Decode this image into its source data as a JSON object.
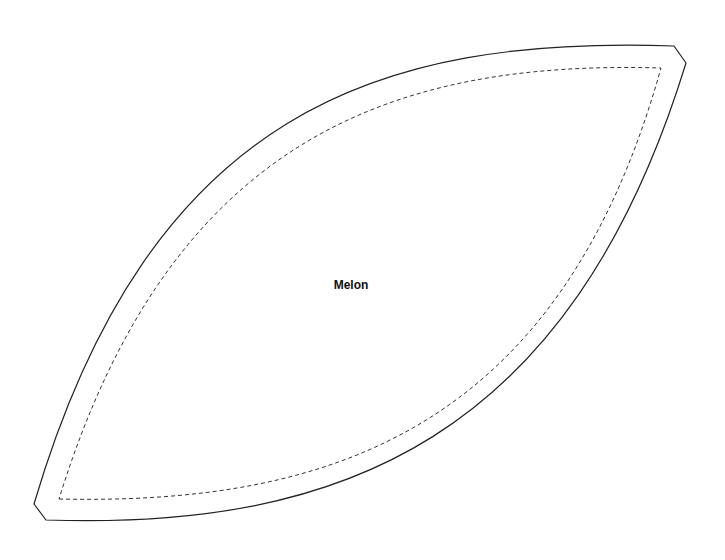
{
  "diagram": {
    "type": "sewing-pattern-piece",
    "piece_label": "Melon",
    "outline": {
      "style": "solid",
      "color": "#222222",
      "description": "cut line, lens/ellipse segment with chamfered pointed ends"
    },
    "seam_line": {
      "style": "dashed",
      "color": "#333333",
      "description": "stitching line inset from cut line"
    },
    "background": "#ffffff"
  }
}
